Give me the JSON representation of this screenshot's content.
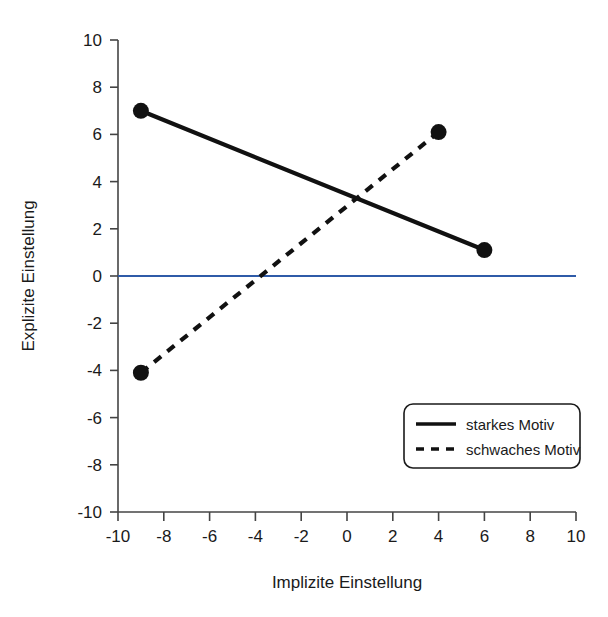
{
  "chart_data": {
    "type": "line",
    "title": "",
    "xlabel": "Implizite Einstellung",
    "ylabel": "Explizite Einstellung",
    "xlim": [
      -10,
      10
    ],
    "ylim": [
      -10,
      10
    ],
    "xticks": [
      -10,
      -8,
      -6,
      -4,
      -2,
      0,
      2,
      4,
      6,
      8,
      10
    ],
    "yticks": [
      -10,
      -8,
      -6,
      -4,
      -2,
      0,
      2,
      4,
      6,
      8,
      10
    ],
    "xtick_labels": [
      "-10",
      "-8",
      "-6",
      "-4",
      "-2",
      "0",
      "2",
      "4",
      "6",
      "8",
      "10"
    ],
    "ytick_labels": [
      "-10",
      "-8",
      "-6",
      "-4",
      "-2",
      "0",
      "2",
      "4",
      "6",
      "8",
      "10"
    ],
    "grid": false,
    "legend_position": "lower right",
    "series": [
      {
        "name": "starkes Motiv",
        "style": "solid",
        "color": "#111111",
        "marker": "filled-circle",
        "x": [
          -9,
          6
        ],
        "y": [
          7.0,
          1.1
        ]
      },
      {
        "name": "schwaches Motiv",
        "style": "dashed",
        "color": "#111111",
        "marker": "filled-circle",
        "x": [
          -9,
          4
        ],
        "y": [
          -4.1,
          6.1
        ]
      }
    ],
    "reference_lines": [
      {
        "name": "zero-line",
        "orientation": "horizontal",
        "value": 0,
        "color": "#2F5BA8"
      }
    ]
  },
  "legend": {
    "entries": [
      {
        "label": "starkes Motiv",
        "style": "solid"
      },
      {
        "label": "schwaches Motiv",
        "style": "dashed"
      }
    ]
  },
  "axes": {
    "x_title": "Implizite Einstellung",
    "y_title": "Explizite Einstellung"
  },
  "colors": {
    "axis": "#444444",
    "series": "#111111",
    "zero_line": "#2F5BA8",
    "background": "#ffffff",
    "text": "#1a1a1a"
  }
}
